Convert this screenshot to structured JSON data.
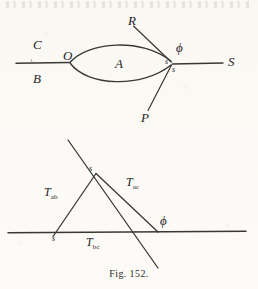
{
  "figure": {
    "caption": "Fig. 152.",
    "background_color": "#fbfaf7",
    "ink_color": "#3a3833"
  },
  "upper_diagram": {
    "name": "lens-force-diagram",
    "labels": {
      "c": "C",
      "b": "B",
      "o": "O",
      "a": "A",
      "r": "R",
      "p": "P",
      "s_ray": "S",
      "phi": "ϕ",
      "s_upper": "s",
      "s_lower": "s"
    }
  },
  "lower_diagram": {
    "name": "tension-triangle-diagram",
    "labels": {
      "t_ab": "T",
      "t_ab_sub": "ab",
      "t_ac": "T",
      "t_ac_sub": "ac",
      "t_bc": "T",
      "t_bc_sub": "bc",
      "s_top": "s",
      "s_bottom": "s",
      "phi": "ϕ"
    }
  }
}
